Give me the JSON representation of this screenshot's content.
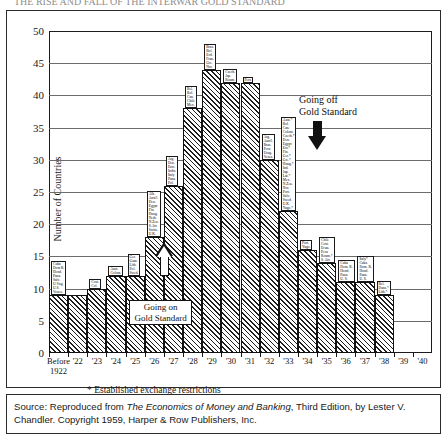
{
  "title_clipped": "THE RISE AND FALL OF THE INTERWAR GOLD STANDARD",
  "axes": {
    "ylabel": "Number of Countries",
    "yticks": [
      "0",
      "5",
      "10",
      "15",
      "20",
      "25",
      "30",
      "35",
      "40",
      "45",
      "50"
    ],
    "ymin": 0,
    "ymax": 50,
    "xtick_first_line1": "Before",
    "xtick_first_line2": "1922"
  },
  "annotations": {
    "going_on": "Going on\nGold Standard",
    "going_on_line1": "Going on",
    "going_on_line2": "Gold Standard",
    "going_off_line1": "Going off",
    "going_off_line2": "Gold Standard"
  },
  "footnote": "* Established exchange restrictions",
  "source": {
    "prefix": "Source: Reproduced from ",
    "italic": "The Economics of Money and Banking",
    "suffix": ", Third Edition, by Lester V. Chandler. Copyright 1959, Harper & Row Publishers, Inc."
  },
  "chart_data": {
    "type": "bar",
    "xlabel": "",
    "ylabel": "Number of Countries",
    "ylim": [
      0,
      50
    ],
    "ytick_step": 5,
    "grid": true,
    "legend": "none",
    "categories": [
      "Before 1922",
      "'22",
      "'23",
      "'24",
      "'25",
      "'26",
      "'27",
      "'28",
      "'29",
      "'30",
      "'31",
      "'32",
      "'33",
      "'34",
      "'35",
      "'36",
      "'37",
      "'38",
      "'39",
      "'40"
    ],
    "values": [
      9,
      9,
      10,
      12,
      12,
      18,
      26,
      38,
      44,
      42,
      42,
      30,
      22,
      16,
      14,
      11,
      11,
      9,
      0,
      0
    ],
    "bar_country_labels": [
      [
        "Cuba",
        "Dom R.",
        "Hond.",
        "Pana.",
        "Salv.",
        "U.Vug.",
        "U.S.",
        "Venez."
      ],
      [
        "Cost.",
        "Col."
      ],
      [
        "Aust.",
        "Colom."
      ],
      [],
      [
        "Ger.",
        "Guat.",
        "Lith.",
        "Pol.",
        "Swed."
      ],
      [
        "Alb.",
        "Aust'l.",
        "Den.",
        "Egypt",
        "Fin.",
        "Hung.",
        "Neth.",
        "N.Zea.",
        "S.Afr.",
        "Switz.",
        "U.K."
      ],
      [
        "Bel.",
        "Bol.",
        "Can.",
        "Chile",
        "Mex."
      ],
      [
        "Arg.",
        "Den.",
        "Esto.",
        "India",
        "Italy",
        "Pana.",
        "Pol."
      ],
      [
        "Braz.",
        "Bol.",
        "Ecd.",
        "Fran.",
        "Gre.",
        "Nor."
      ],
      [
        "Czech.",
        "Jap.",
        "Roum."
      ],
      [
        "Peru"
      ],
      [
        "Arg.",
        "Aust'l.",
        "Braz.",
        "Peru",
        "Urug.",
        "Venez."
      ],
      [
        "Aust.*",
        "Bol.",
        "Can.",
        "Colom.",
        "Czech.*",
        "Den.",
        "Egypt",
        "Est.*",
        "Fin.",
        "Ger.*",
        "Gre.*",
        "Hung.*",
        "Ind.",
        "Jap.",
        "Lat.*",
        "Mex.",
        "N.Zea.",
        "Nor.",
        "Port.",
        "Salv.",
        "Swed.",
        "U.K.",
        "Yugo.*"
      ],
      [
        "Port.",
        "Yugo."
      ],
      [
        "Chile",
        "Cost.",
        "Ecua.",
        "Peru",
        "Roum.*",
        "S. Afr."
      ],
      [
        "Cuba",
        "Dom. R.",
        "Hond.",
        "Pana.",
        "U. S."
      ],
      [
        "Italy*",
        "Cuba",
        "Dom. R.",
        "Hond.",
        "Pana.",
        "U. S."
      ],
      [
        "Bel.",
        "Danz.*",
        "Lith.*",
        "Bel."
      ],
      [
        "Fran.",
        "Neth.",
        "Pol.*"
      ],
      []
    ],
    "bar_label_assignments": {
      "Before 1922": [
        "Cuba",
        "Dom R.",
        "Hond.",
        "Pana.",
        "Salv.",
        "U.Vug.",
        "U.S.",
        "Venez."
      ],
      "'23": [
        "Cost.",
        "Col."
      ],
      "'24": [
        "Aust.",
        "Colom."
      ],
      "'25": [
        "Ger.",
        "Guat.",
        "Lith.",
        "Pol.",
        "Swed."
      ],
      "'26": [
        "Alb.",
        "Aust'l.",
        "Den.",
        "Egypt",
        "Fin.",
        "Hung.",
        "Neth.",
        "N.Zea.",
        "S.Afr.",
        "Switz.",
        "U.K."
      ],
      "'27": [
        "Arg.",
        "Den.",
        "Esto.",
        "India",
        "Italy",
        "Pana.",
        "Pol."
      ],
      "'28": [
        "Bel.",
        "Bol.",
        "Can.",
        "Chile",
        "Mex."
      ],
      "'29": [
        "Braz.",
        "Bol.",
        "Ecd.",
        "Fran.",
        "Gre.",
        "Nor."
      ],
      "'30": [
        "Czech.",
        "Jap.",
        "Roum."
      ],
      "'31": [
        "Peru"
      ],
      "'32": [
        "Arg.",
        "Aust'l.",
        "Braz.",
        "Peru",
        "Urug.",
        "Venez."
      ],
      "'33": [
        "Aust.*",
        "Bol.",
        "Can.",
        "Colom.",
        "Czech.*",
        "Den.",
        "Egypt",
        "Est.*",
        "Fin.",
        "Ger.*",
        "Gre.*",
        "Hung.*",
        "Ind.",
        "Jap.",
        "Lat.*",
        "Mex.",
        "N.Zea.",
        "Nor.",
        "Port.",
        "Salv.",
        "Swed.",
        "U.K.",
        "Yugo.*"
      ],
      "'34": [
        "Port.",
        "Yugo."
      ],
      "'35": [
        "Chile",
        "Cost.",
        "Ecua.",
        "Peru",
        "Roum.*",
        "S. Afr."
      ],
      "'36": [
        "Cuba",
        "Dom. R.",
        "Hond.",
        "Pana.",
        "U. S."
      ],
      "'37": [
        "Italy*",
        "Cuba",
        "Dom. R.",
        "Hond.",
        "Pana.",
        "U. S."
      ],
      "'38": [
        "Bel.",
        "Danz.*",
        "Lith.*"
      ],
      "'39": [
        "Fran.",
        "Neth.",
        "Pol.*"
      ]
    }
  }
}
